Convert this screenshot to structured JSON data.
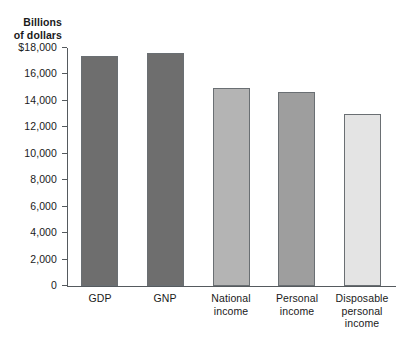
{
  "chart_data": {
    "type": "bar",
    "title": "",
    "ylabel": "Billions of dollars",
    "xlabel": "",
    "ylim": [
      0,
      18000
    ],
    "grid": false,
    "legend": "none",
    "categories": [
      "GDP",
      "GNP",
      "National income",
      "Personal income",
      "Disposable personal income"
    ],
    "values": [
      17400,
      17600,
      15000,
      14700,
      13000
    ],
    "bar_colors": [
      "#6e6e6e",
      "#6e6e6e",
      "#b4b4b4",
      "#9e9e9e",
      "#e4e4e4"
    ],
    "ytick_labels": [
      "$18,000",
      "16,000",
      "14,000",
      "12,000",
      "10,000",
      "8,000",
      "6,000",
      "4,000",
      "2,000",
      "0"
    ],
    "ytick_values": [
      18000,
      16000,
      14000,
      12000,
      10000,
      8000,
      6000,
      4000,
      2000,
      0
    ]
  },
  "axis_title": {
    "line1": "Billions",
    "line2": "of dollars"
  },
  "category_labels": [
    {
      "line1": "GDP",
      "line2": "",
      "line3": ""
    },
    {
      "line1": "GNP",
      "line2": "",
      "line3": ""
    },
    {
      "line1": "National",
      "line2": "income",
      "line3": ""
    },
    {
      "line1": "Personal",
      "line2": "income",
      "line3": ""
    },
    {
      "line1": "Disposable",
      "line2": "personal",
      "line3": "income"
    }
  ]
}
